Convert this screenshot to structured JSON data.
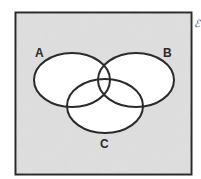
{
  "diagram": {
    "type": "venn",
    "universal_set_label": "ℰ",
    "universe_fill": "#dcdcdc",
    "set_fill": "#ffffff",
    "stroke_color": "#2a2a2a",
    "sets": [
      {
        "label": "A",
        "cx": 72,
        "cy": 80,
        "rx": 38,
        "ry": 27
      },
      {
        "label": "B",
        "cx": 136,
        "cy": 80,
        "rx": 38,
        "ry": 27
      },
      {
        "label": "C",
        "cx": 105,
        "cy": 106,
        "rx": 38,
        "ry": 27
      }
    ]
  }
}
